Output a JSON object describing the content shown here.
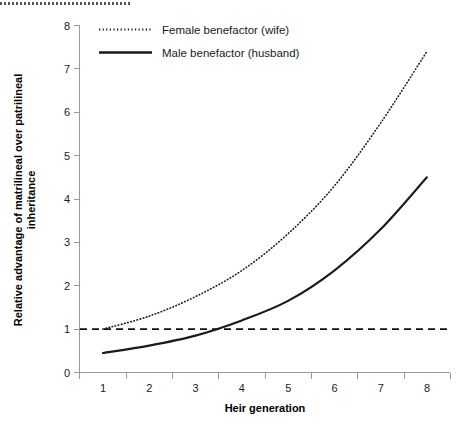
{
  "chart_data": {
    "type": "line",
    "title": "",
    "xlabel": "Heir generation",
    "ylabel": "Relative advantage of matrilineal over patrilineal inheritance",
    "ylabel_line1": "Relative advantage of matrilineal over patrilineal",
    "ylabel_line2": "inheritance",
    "categories": [
      "1",
      "2",
      "3",
      "4",
      "5",
      "6",
      "7",
      "8"
    ],
    "x": [
      1,
      2,
      3,
      4,
      5,
      6,
      7,
      8
    ],
    "xlim": [
      0.5,
      8.5
    ],
    "ylim": [
      0,
      8
    ],
    "y_ticks": [
      "0",
      "1",
      "2",
      "3",
      "4",
      "5",
      "6",
      "7",
      "8"
    ],
    "x_axis_style": "category ticks at category boundaries, labels centered between ticks",
    "grid": false,
    "legend_position": "inside plot, upper left",
    "series": [
      {
        "name": "Female benefactor (wife)",
        "style": "dotted",
        "values": [
          1.0,
          1.3,
          1.75,
          2.35,
          3.2,
          4.3,
          5.75,
          7.4
        ]
      },
      {
        "name": "Male benefactor (husband)",
        "style": "solid",
        "values": [
          0.45,
          0.62,
          0.85,
          1.2,
          1.65,
          2.35,
          3.3,
          4.5
        ]
      }
    ],
    "reference_lines": [
      {
        "name": "parity-line",
        "orientation": "horizontal",
        "value": 1,
        "style": "dashed"
      }
    ],
    "colors": {
      "series_line": "#1a1a1a",
      "axis": "#9a9a9a",
      "reference": "#111111",
      "background": "#ffffff"
    }
  },
  "legend": {
    "items": [
      {
        "label": "Female benefactor (wife)",
        "style": "dotted"
      },
      {
        "label": "Male benefactor (husband)",
        "style": "solid"
      }
    ]
  },
  "y_axis": {
    "ticks": [
      "0",
      "1",
      "2",
      "3",
      "4",
      "5",
      "6",
      "7",
      "8"
    ],
    "title_line1": "Relative advantage of matrilineal over patrilineal",
    "title_line2": "inheritance"
  },
  "x_axis": {
    "ticks": [
      "1",
      "2",
      "3",
      "4",
      "5",
      "6",
      "7",
      "8"
    ],
    "title": "Heir generation"
  }
}
